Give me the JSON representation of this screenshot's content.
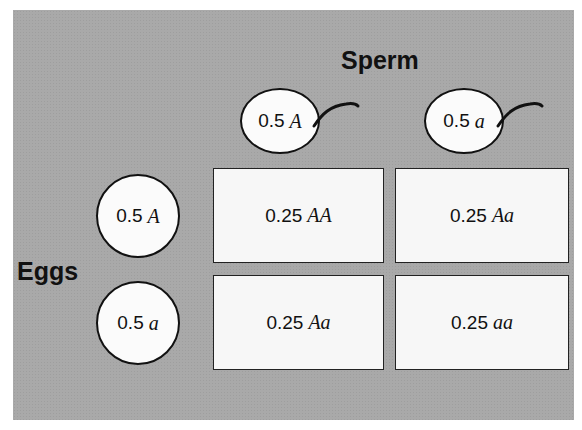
{
  "diagram": {
    "type": "punnett-square",
    "sperm_label": "Sperm",
    "eggs_label": "Eggs",
    "sperm": [
      {
        "freq": "0.5",
        "allele": "A"
      },
      {
        "freq": "0.5",
        "allele": "a"
      }
    ],
    "eggs": [
      {
        "freq": "0.5",
        "allele": "A"
      },
      {
        "freq": "0.5",
        "allele": "a"
      }
    ],
    "cells": [
      {
        "freq": "0.25",
        "genotype": "AA"
      },
      {
        "freq": "0.25",
        "genotype": "Aa"
      },
      {
        "freq": "0.25",
        "genotype": "Aa"
      },
      {
        "freq": "0.25",
        "genotype": "aa"
      }
    ],
    "colors": {
      "background": "#a9a9a9",
      "cell_fill": "#f7f7f7",
      "outline": "#111111"
    }
  }
}
